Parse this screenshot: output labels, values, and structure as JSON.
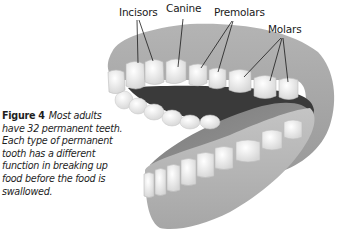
{
  "figure": {
    "number": "Figure 4",
    "caption_lines": [
      "Most adults",
      "have 32 permanent teeth.",
      "Each type of permanent",
      "tooth has a different",
      "function in breaking up",
      "food before the food is",
      "swallowed."
    ],
    "illustration": "open-mouth-teeth-illustration",
    "labels": {
      "incisors": "Incisors",
      "canine": "Canine",
      "premolars": "Premolars",
      "molars": "Molars"
    },
    "colors": {
      "gum": "#a8a8a8",
      "gum_dark": "#8c8c8c",
      "tooth": "#f2f2f2",
      "mouth_interior": "#3a3a3a",
      "leader_line": "#1a1a1a",
      "text": "#1e1e1e"
    }
  }
}
